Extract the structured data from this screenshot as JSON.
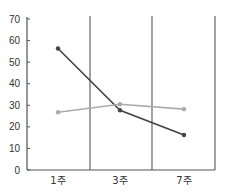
{
  "chart_data": {
    "type": "line",
    "title": "",
    "xlabel": "",
    "ylabel": "",
    "categories": [
      "1주",
      "3주",
      "7주"
    ],
    "ylim": [
      0,
      70
    ],
    "yticks": [
      0,
      10,
      20,
      30,
      40,
      50,
      60,
      70
    ],
    "grid": "vertical separators between categories",
    "legend": "none",
    "series": [
      {
        "name": "series-dark",
        "color": "#444444",
        "values": [
          56.3,
          27.7,
          16.2
        ]
      },
      {
        "name": "series-light",
        "color": "#aaaaaa",
        "values": [
          26.8,
          30.5,
          28.2
        ]
      }
    ]
  },
  "colors": {
    "axis": "#555555",
    "separator": "#555555"
  }
}
